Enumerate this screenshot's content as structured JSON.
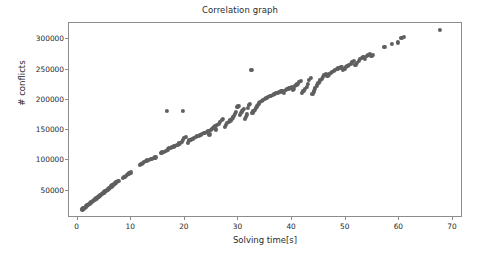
{
  "chart_data": {
    "type": "scatter",
    "title": "Correlation graph",
    "xlabel": "Solving time[s]",
    "ylabel": "# conflicts",
    "xlim": [
      -1.6,
      71.5
    ],
    "ylim": [
      8000,
      327000
    ],
    "xticks": [
      0,
      10,
      20,
      30,
      40,
      50,
      60,
      70
    ],
    "xtick_labels": [
      "0",
      "10",
      "20",
      "30",
      "40",
      "50",
      "60",
      "70"
    ],
    "yticks": [
      50000,
      100000,
      150000,
      200000,
      250000,
      300000
    ],
    "ytick_labels": [
      "50000",
      "100000",
      "150000",
      "200000",
      "250000",
      "300000"
    ],
    "grid": false,
    "legend": null,
    "marker_color": "#5f5f5f",
    "marker_size": 4.2,
    "series": [
      {
        "name": "solver runs",
        "points": [
          [
            0.9,
            19000
          ],
          [
            1.0,
            20000
          ],
          [
            1.1,
            20500
          ],
          [
            1.2,
            21500
          ],
          [
            1.3,
            22000
          ],
          [
            1.5,
            23500
          ],
          [
            1.6,
            24000
          ],
          [
            1.8,
            25500
          ],
          [
            1.9,
            26000
          ],
          [
            2.0,
            27000
          ],
          [
            2.2,
            28500
          ],
          [
            2.3,
            29500
          ],
          [
            2.5,
            30500
          ],
          [
            2.6,
            31500
          ],
          [
            2.8,
            32500
          ],
          [
            2.9,
            33000
          ],
          [
            3.0,
            34000
          ],
          [
            3.2,
            35000
          ],
          [
            3.3,
            36000
          ],
          [
            3.5,
            37000
          ],
          [
            3.6,
            38000
          ],
          [
            3.8,
            39000
          ],
          [
            3.9,
            40000
          ],
          [
            4.0,
            41000
          ],
          [
            4.2,
            42000
          ],
          [
            4.3,
            43000
          ],
          [
            4.5,
            44000
          ],
          [
            4.6,
            45000
          ],
          [
            4.8,
            46000
          ],
          [
            4.9,
            47000
          ],
          [
            5.0,
            48000
          ],
          [
            5.2,
            49000
          ],
          [
            5.3,
            50000
          ],
          [
            5.5,
            51000
          ],
          [
            5.6,
            52000
          ],
          [
            5.8,
            53000
          ],
          [
            5.9,
            54000
          ],
          [
            6.0,
            55000
          ],
          [
            6.2,
            56000
          ],
          [
            6.3,
            57000
          ],
          [
            6.5,
            58500
          ],
          [
            6.6,
            59500
          ],
          [
            6.8,
            60500
          ],
          [
            6.9,
            61500
          ],
          [
            7.0,
            62500
          ],
          [
            7.2,
            63500
          ],
          [
            7.4,
            64500
          ],
          [
            7.6,
            65500
          ],
          [
            8.4,
            71000
          ],
          [
            8.6,
            72000
          ],
          [
            8.8,
            73000
          ],
          [
            9.0,
            74000
          ],
          [
            9.2,
            75500
          ],
          [
            9.4,
            77000
          ],
          [
            9.6,
            78500
          ],
          [
            9.8,
            79500
          ],
          [
            10.0,
            80000
          ],
          [
            11.6,
            92000
          ],
          [
            11.9,
            94000
          ],
          [
            12.2,
            96000
          ],
          [
            12.4,
            97000
          ],
          [
            12.7,
            99000
          ],
          [
            13.0,
            100000
          ],
          [
            13.3,
            101000
          ],
          [
            13.6,
            102000
          ],
          [
            13.9,
            103000
          ],
          [
            14.2,
            104000
          ],
          [
            14.5,
            105000
          ],
          [
            15.5,
            112000
          ],
          [
            15.8,
            113000
          ],
          [
            16.1,
            114000
          ],
          [
            16.4,
            115500
          ],
          [
            16.6,
            182000
          ],
          [
            16.8,
            118000
          ],
          [
            17.1,
            120000
          ],
          [
            17.4,
            121000
          ],
          [
            17.6,
            122000
          ],
          [
            17.9,
            123000
          ],
          [
            18.2,
            124500
          ],
          [
            18.6,
            126000
          ],
          [
            19.0,
            128000
          ],
          [
            19.4,
            131000
          ],
          [
            19.6,
            134000
          ],
          [
            19.7,
            182000
          ],
          [
            19.9,
            137000
          ],
          [
            20.2,
            139000
          ],
          [
            20.5,
            129000
          ],
          [
            20.8,
            133000
          ],
          [
            21.1,
            134000
          ],
          [
            21.4,
            135500
          ],
          [
            21.7,
            137000
          ],
          [
            22.0,
            138500
          ],
          [
            22.3,
            140000
          ],
          [
            22.6,
            141000
          ],
          [
            22.9,
            142000
          ],
          [
            23.2,
            143500
          ],
          [
            23.5,
            145000
          ],
          [
            23.8,
            146000
          ],
          [
            24.1,
            147500
          ],
          [
            24.4,
            149000
          ],
          [
            24.6,
            143000
          ],
          [
            24.8,
            150000
          ],
          [
            25.0,
            152000
          ],
          [
            25.2,
            153000
          ],
          [
            25.4,
            154500
          ],
          [
            25.6,
            156000
          ],
          [
            25.8,
            151000
          ],
          [
            26.0,
            158000
          ],
          [
            26.3,
            160000
          ],
          [
            26.6,
            163000
          ],
          [
            26.9,
            167000
          ],
          [
            27.1,
            168000
          ],
          [
            27.4,
            155000
          ],
          [
            27.6,
            159000
          ],
          [
            27.9,
            162000
          ],
          [
            28.2,
            164000
          ],
          [
            28.5,
            166000
          ],
          [
            28.8,
            169000
          ],
          [
            29.0,
            171000
          ],
          [
            29.2,
            174000
          ],
          [
            29.4,
            177000
          ],
          [
            29.6,
            180000
          ],
          [
            29.8,
            188000
          ],
          [
            30.0,
            190000
          ],
          [
            30.2,
            175000
          ],
          [
            30.4,
            178000
          ],
          [
            30.6,
            181000
          ],
          [
            30.8,
            183000
          ],
          [
            31.0,
            185000
          ],
          [
            31.2,
            168000
          ],
          [
            31.4,
            172000
          ],
          [
            31.6,
            176000
          ],
          [
            31.8,
            186000
          ],
          [
            32.0,
            191000
          ],
          [
            32.2,
            193000
          ],
          [
            32.4,
            249000
          ],
          [
            32.6,
            179000
          ],
          [
            32.8,
            182000
          ],
          [
            33.0,
            184000
          ],
          [
            33.2,
            187000
          ],
          [
            33.4,
            189000
          ],
          [
            33.6,
            192000
          ],
          [
            33.8,
            194000
          ],
          [
            34.0,
            196000
          ],
          [
            34.3,
            198000
          ],
          [
            34.6,
            200000
          ],
          [
            34.9,
            202000
          ],
          [
            35.2,
            203000
          ],
          [
            35.5,
            204500
          ],
          [
            35.8,
            206000
          ],
          [
            36.1,
            207000
          ],
          [
            36.4,
            208500
          ],
          [
            36.7,
            210000
          ],
          [
            37.0,
            211000
          ],
          [
            37.3,
            212000
          ],
          [
            37.6,
            213000
          ],
          [
            37.9,
            214000
          ],
          [
            38.2,
            215000
          ],
          [
            38.5,
            212000
          ],
          [
            38.8,
            216000
          ],
          [
            39.1,
            217500
          ],
          [
            39.4,
            219000
          ],
          [
            39.7,
            220000
          ],
          [
            40.0,
            221500
          ],
          [
            40.2,
            216000
          ],
          [
            40.4,
            218000
          ],
          [
            40.6,
            223000
          ],
          [
            40.8,
            225000
          ],
          [
            41.0,
            227000
          ],
          [
            41.3,
            229000
          ],
          [
            41.6,
            231000
          ],
          [
            41.9,
            212000
          ],
          [
            42.1,
            215000
          ],
          [
            42.4,
            218000
          ],
          [
            42.7,
            222000
          ],
          [
            43.0,
            226000
          ],
          [
            43.2,
            233000
          ],
          [
            43.5,
            236000
          ],
          [
            43.8,
            210000
          ],
          [
            44.0,
            214000
          ],
          [
            44.3,
            219000
          ],
          [
            44.6,
            224000
          ],
          [
            44.9,
            228000
          ],
          [
            45.2,
            232000
          ],
          [
            45.5,
            235000
          ],
          [
            45.8,
            238000
          ],
          [
            46.0,
            241000
          ],
          [
            46.3,
            243000
          ],
          [
            46.6,
            240000
          ],
          [
            46.9,
            242000
          ],
          [
            47.2,
            244000
          ],
          [
            47.5,
            246000
          ],
          [
            47.8,
            248000
          ],
          [
            48.0,
            250000
          ],
          [
            48.3,
            251000
          ],
          [
            48.6,
            252000
          ],
          [
            48.9,
            253000
          ],
          [
            49.2,
            254000
          ],
          [
            49.5,
            249000
          ],
          [
            49.8,
            251000
          ],
          [
            50.0,
            255000
          ],
          [
            50.3,
            256500
          ],
          [
            50.6,
            258000
          ],
          [
            50.9,
            260000
          ],
          [
            51.2,
            262000
          ],
          [
            51.5,
            264000
          ],
          [
            51.8,
            258000
          ],
          [
            52.1,
            261000
          ],
          [
            52.4,
            265000
          ],
          [
            52.7,
            267000
          ],
          [
            53.0,
            269000
          ],
          [
            53.3,
            271000
          ],
          [
            53.6,
            268000
          ],
          [
            53.9,
            272000
          ],
          [
            54.2,
            274000
          ],
          [
            54.5,
            276000
          ],
          [
            54.8,
            272000
          ],
          [
            55.1,
            274000
          ],
          [
            57.2,
            288000
          ],
          [
            58.6,
            292000
          ],
          [
            59.8,
            295000
          ],
          [
            60.4,
            302000
          ],
          [
            60.8,
            304000
          ],
          [
            67.5,
            315000
          ]
        ]
      }
    ]
  },
  "figure": {
    "background_color": "#ffffff",
    "axes_color": "#8c8c8c",
    "text_color": "#2b2b2b"
  }
}
